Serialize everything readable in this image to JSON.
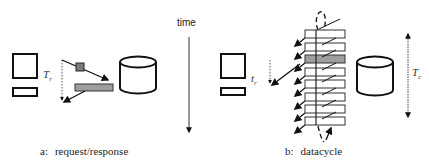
{
  "diagram": {
    "time_axis": {
      "label": "time",
      "direction": "down"
    },
    "panel_a": {
      "caption_prefix": "a:",
      "caption_text": "request/response",
      "client": {
        "type": "terminal",
        "label_main": "T",
        "label_sub": "r"
      },
      "server": {
        "type": "database-cylinder"
      },
      "request_packet_color": "#7a7a7a",
      "response_bar_color": "#9e9e9e"
    },
    "panel_b": {
      "caption_prefix": "b:",
      "caption_text": "datacycle",
      "client": {
        "type": "terminal",
        "label_main": "t",
        "label_sub": "r"
      },
      "server": {
        "type": "database-cylinder"
      },
      "cycle_slots": 8,
      "highlighted_slot": 3,
      "highlight_color": "#9e9e9e",
      "cycle_period": {
        "label_main": "T",
        "label_sub": "c"
      }
    }
  }
}
